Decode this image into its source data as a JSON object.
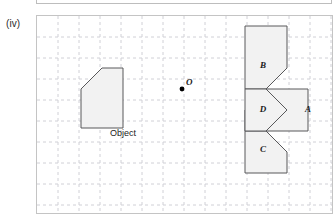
{
  "item": {
    "label": "(iv)"
  },
  "panel": {
    "grid": {
      "cell_px": 21,
      "line_color": "#d0d0d6",
      "line_style": "dashed",
      "background": "#ffffff",
      "border_color": "#c4c4c4",
      "cols": 14,
      "rows": 9
    }
  },
  "figure": {
    "type": "rotational-symmetry-diagram",
    "centre_of_rotation": {
      "name": "O",
      "label": "O",
      "x": 145,
      "y": 73,
      "dot_radius": 2.4
    },
    "object": {
      "label": "Object",
      "label_x": 86,
      "label_y": 120,
      "points": "44,73 65,52 86,52 86,112 44,112",
      "fill": "#f2f2f2",
      "stroke": "#58585a"
    },
    "images": [
      {
        "label": "A",
        "label_x": 271,
        "label_y": 96,
        "points": "208,94 229,73 271,73 271,115 208,115",
        "fill": "#f2f2f2",
        "stroke": "#58585a"
      },
      {
        "label": "B",
        "label_x": 226,
        "label_y": 52,
        "points": "208,10 250,10 250,52 229,73 208,73",
        "fill": "#f2f2f2",
        "stroke": "#58585a"
      },
      {
        "label": "C",
        "label_x": 226,
        "label_y": 136,
        "points": "208,115 229,115 250,136 250,157 208,157",
        "fill": "#f2f2f2",
        "stroke": "#58585a"
      },
      {
        "label": "D",
        "label_x": 226,
        "label_y": 96,
        "points": "208,73 229,73 250,94 229,115 208,115",
        "fill": "#f2f2f2",
        "stroke": "#58585a"
      }
    ]
  },
  "colors": {
    "shape_fill": "#f2f2f2",
    "shape_stroke": "#58585a",
    "grid_line": "#d0d0d6",
    "panel_border": "#c4c4c4",
    "text": "#1b1b1b"
  }
}
